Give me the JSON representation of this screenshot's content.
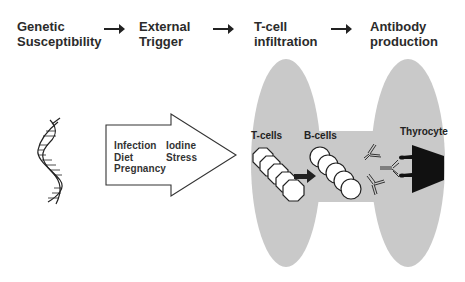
{
  "stages": [
    {
      "label": "Genetic\nSusceptibility"
    },
    {
      "label": "External\nTrigger"
    },
    {
      "label": "T-cell\ninfiltration"
    },
    {
      "label": "Antibody\nproduction"
    }
  ],
  "triggers": {
    "column1": "Infection\nDiet\nPregnancy",
    "column2": "Iodine\nStress"
  },
  "cells": {
    "t_cells": "T-cells",
    "b_cells": "B-cells",
    "thyrocyte": "Thyrocyte"
  },
  "icons": {
    "dna": "dna-helix-icon",
    "flow_arrow": "right-arrow-icon",
    "trigger_arrow": "block-arrow-icon",
    "t_cell": "octagon-cell-icon",
    "b_cell": "circle-cell-icon",
    "antibody": "y-antibody-icon",
    "thyrocyte": "trapezoid-thyrocyte-icon"
  },
  "colors": {
    "ellipse_fill": "#c9c9c9",
    "text": "#2b2b2b",
    "thyrocyte": "#111111"
  }
}
